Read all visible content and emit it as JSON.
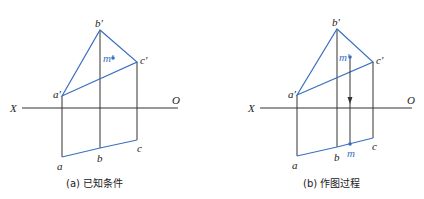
{
  "colors": {
    "edge": "#3a6fc0",
    "line": "#333333",
    "point": "#3a6fc0"
  },
  "panels": [
    {
      "id": "a",
      "caption": "(a) 已知条件",
      "axis": {
        "left_label": "X",
        "right_label": "O"
      },
      "labels": {
        "a_prime": "a′",
        "b_prime": "b′",
        "c_prime": "c′",
        "m_prime": "m′",
        "a": "a",
        "b": "b",
        "c": "c"
      }
    },
    {
      "id": "b",
      "caption": "(b) 作图过程",
      "axis": {
        "left_label": "X",
        "right_label": "O"
      },
      "labels": {
        "a_prime": "a′",
        "b_prime": "b′",
        "c_prime": "c′",
        "m_prime": "m′",
        "a": "a",
        "b": "b",
        "c": "c",
        "m": "m"
      }
    }
  ]
}
